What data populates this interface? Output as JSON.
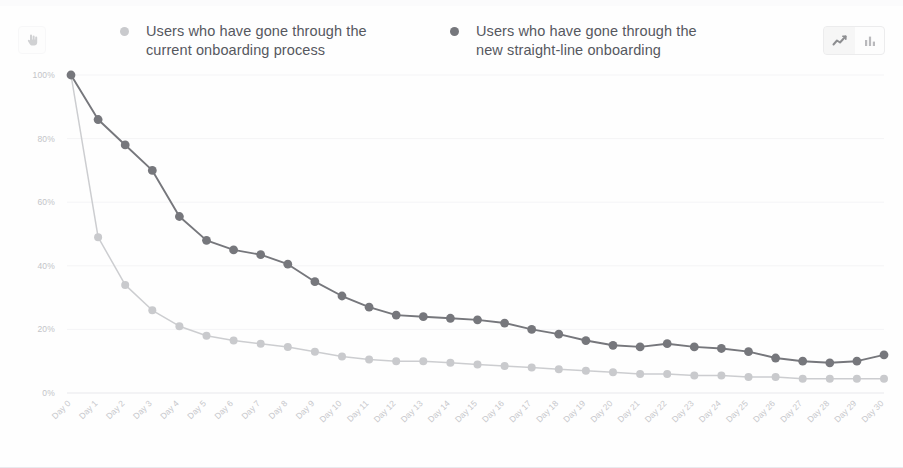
{
  "header": {
    "left_icon": "hand-pointer-icon",
    "legend": [
      {
        "label": "Users who have gone through the current onboarding process",
        "color": "#c9cacd",
        "marker": "legend-dot-icon"
      },
      {
        "label": "Users who have gone through the new straight-line onboarding",
        "color": "#76777c",
        "marker": "legend-dot-icon"
      }
    ],
    "view_toggle": {
      "options": [
        {
          "name": "line-chart-icon",
          "label": "Line chart",
          "selected": true
        },
        {
          "name": "bar-chart-icon",
          "label": "Bar chart",
          "selected": false
        }
      ]
    }
  },
  "chart_data": {
    "type": "line",
    "title": "",
    "xlabel": "",
    "ylabel": "",
    "ylim": [
      0,
      100
    ],
    "yticks": [
      0,
      20,
      40,
      60,
      80,
      100
    ],
    "ytick_labels": [
      "0%",
      "20%",
      "40%",
      "60%",
      "80%",
      "100%"
    ],
    "grid": true,
    "legend_position": "top",
    "x": [
      "Day 0",
      "Day 1",
      "Day 2",
      "Day 3",
      "Day 4",
      "Day 5",
      "Day 6",
      "Day 7",
      "Day 8",
      "Day 9",
      "Day 10",
      "Day 11",
      "Day 12",
      "Day 13",
      "Day 14",
      "Day 15",
      "Day 16",
      "Day 17",
      "Day 18",
      "Day 19",
      "Day 20",
      "Day 21",
      "Day 22",
      "Day 23",
      "Day 24",
      "Day 25",
      "Day 26",
      "Day 27",
      "Day 28",
      "Day 29",
      "Day 30"
    ],
    "series": [
      {
        "name": "Users who have gone through the current onboarding process",
        "color": "#c9cacd",
        "values": [
          100,
          49,
          34,
          26,
          21,
          18,
          16.5,
          15.5,
          14.5,
          13,
          11.5,
          10.5,
          10,
          10,
          9.5,
          9,
          8.5,
          8,
          7.5,
          7,
          6.5,
          6,
          6,
          5.5,
          5.5,
          5,
          5,
          4.5,
          4.5,
          4.5,
          4.5
        ]
      },
      {
        "name": "Users who have gone through the new straight-line onboarding",
        "color": "#76777c",
        "values": [
          100,
          86,
          78,
          70,
          55.5,
          48,
          45,
          43.5,
          40.5,
          35,
          30.5,
          27,
          24.5,
          24,
          23.5,
          23,
          22,
          20,
          18.5,
          16.5,
          15,
          14.5,
          15.5,
          14.5,
          14,
          13,
          11,
          10,
          9.5,
          10,
          12
        ]
      }
    ]
  }
}
